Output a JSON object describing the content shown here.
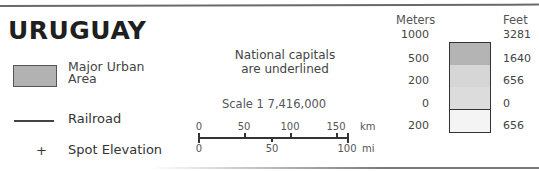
{
  "title": "URUGUAY",
  "legend": {
    "urban": {
      "label_line1": "Major Urban",
      "label_line2": "Area",
      "swatch_color": "#b2b2b2"
    },
    "railroad": {
      "label": "Railroad"
    },
    "spot_elevation": {
      "symbol": "+",
      "label": "Spot Elevation"
    }
  },
  "note": {
    "line1": "National capitals",
    "line2": "are underlined"
  },
  "scale": {
    "title": "Scale 1 7,416,000",
    "km": {
      "unit": "km",
      "ticks": [
        "0",
        "50",
        "100",
        "150"
      ]
    },
    "mi": {
      "unit": "mi",
      "ticks": [
        "0",
        "50",
        "100"
      ]
    }
  },
  "elevation": {
    "meters_header": "Meters",
    "feet_header": "Feet",
    "meters": [
      "1000",
      "500",
      "200",
      "0",
      "200"
    ],
    "feet": [
      "3281",
      "1640",
      "656",
      "0",
      "656"
    ],
    "band_colors": [
      "#b4b4b4",
      "#d6d6d6",
      "#dcdcdc",
      "#f4f4f4"
    ]
  }
}
